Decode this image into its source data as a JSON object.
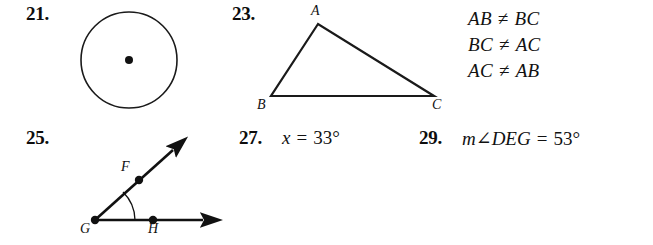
{
  "page": {
    "background": "#ffffff",
    "ink": "#111111",
    "width": 653,
    "height": 245
  },
  "exercises": [
    {
      "number": "21.",
      "type": "circle-figure",
      "figure": {
        "name": "circle-with-center-point",
        "center": {
          "x": 129,
          "y": 60
        },
        "radius": 48,
        "center_dot_radius": 4
      }
    },
    {
      "number": "23.",
      "type": "triangle-figure",
      "figure": {
        "name": "scalene-triangle-ABC",
        "vertices": [
          {
            "label": "A",
            "x": 318,
            "y": 24,
            "label_x": 311,
            "label_y": 4
          },
          {
            "label": "B",
            "x": 271,
            "y": 96,
            "label_x": 257,
            "label_y": 99
          },
          {
            "label": "C",
            "x": 434,
            "y": 96,
            "label_x": 432,
            "label_y": 99
          }
        ]
      },
      "answer_lines": [
        {
          "left": "AB",
          "rel": "≠",
          "right": "BC"
        },
        {
          "left": "BC",
          "rel": "≠",
          "right": "AC"
        },
        {
          "left": "AC",
          "rel": "≠",
          "right": "AB"
        }
      ]
    },
    {
      "number": "25.",
      "type": "angle-figure",
      "figure": {
        "name": "angle-FGH-with-rays",
        "vertex": {
          "label": "G",
          "x": 95,
          "y": 220,
          "label_x": 80,
          "label_y": 223
        },
        "ray_points": [
          {
            "label": "F",
            "x": 139,
            "y": 180,
            "label_x": 120,
            "label_y": 162
          },
          {
            "label": "H",
            "x": 153,
            "y": 220,
            "label_x": 148,
            "label_y": 223
          }
        ],
        "ray_tips": [
          {
            "x": 178,
            "y": 145
          },
          {
            "x": 210,
            "y": 220
          }
        ],
        "arc_radius": 40
      }
    },
    {
      "number": "27.",
      "type": "equation",
      "answer": {
        "variable": "x",
        "equals": "=",
        "value": "33°"
      }
    },
    {
      "number": "29.",
      "type": "equation",
      "answer": {
        "variable": "m∠DEG",
        "equals": "=",
        "value": "53°"
      }
    }
  ],
  "positions": {
    "num21": {
      "x": 26,
      "y": 3
    },
    "num23": {
      "x": 232,
      "y": 3
    },
    "num25": {
      "x": 26,
      "y": 127
    },
    "num27": {
      "x": 239,
      "y": 127
    },
    "num29": {
      "x": 419,
      "y": 127
    },
    "eq27": {
      "x": 282,
      "y": 127
    },
    "eq29": {
      "x": 462,
      "y": 127
    }
  }
}
